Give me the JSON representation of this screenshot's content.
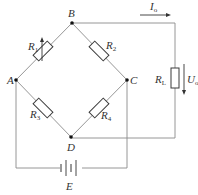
{
  "diagram": {
    "nodes": {
      "A": {
        "label": "A"
      },
      "B": {
        "label": "B"
      },
      "C": {
        "label": "C"
      },
      "D": {
        "label": "D"
      }
    },
    "resistors": [
      {
        "id": "R1",
        "label_main": "R",
        "label_sub": "1",
        "between": "A-B",
        "variable": true
      },
      {
        "id": "R2",
        "label_main": "R",
        "label_sub": "2",
        "between": "B-C"
      },
      {
        "id": "R3",
        "label_main": "R",
        "label_sub": "3",
        "between": "A-D"
      },
      {
        "id": "R4",
        "label_main": "R",
        "label_sub": "4",
        "between": "D-C"
      },
      {
        "id": "RL",
        "label_main": "R",
        "label_sub": "L",
        "between": "B-D (load)"
      }
    ],
    "source": {
      "label": "E"
    },
    "current": {
      "label_main": "I",
      "label_sub": "o"
    },
    "voltage": {
      "label_main": "U",
      "label_sub": "o"
    }
  }
}
